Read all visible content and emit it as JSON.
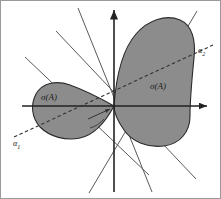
{
  "figure": {
    "name": "numerical-range-rotation-diagram",
    "background_color": "#ffffff",
    "blob_fill_color": "#8c8c8c",
    "blob_stroke_color": "#2b2b2b",
    "axis_color": "#222222",
    "ray_color": "#555555",
    "dashed_color": "#333333",
    "labels": {
      "sigma_left": "σ(A)",
      "sigma_right": "σ(A)",
      "alpha_1": "α",
      "alpha_1_sub": "1",
      "alpha_2": "α",
      "alpha_2_sub": "2"
    },
    "geometry": {
      "origin": [
        114,
        106
      ],
      "vertical_axis": [
        [
          114,
          8
        ],
        [
          114,
          192
        ]
      ],
      "horizontal_axis": [
        [
          22,
          106
        ],
        [
          209,
          106
        ]
      ],
      "dashed_axis": [
        [
          14,
          136
        ],
        [
          214,
          44
        ]
      ],
      "rays": [
        [
          [
            78,
            8
          ],
          [
            152,
            192
          ]
        ],
        [
          [
            25,
            57
          ],
          [
            148,
            174
          ]
        ],
        [
          [
            90,
            192
          ],
          [
            196,
            12
          ]
        ],
        [
          [
            196,
            178
          ],
          [
            55,
            30
          ]
        ]
      ],
      "right_blob_extent": [
        118,
        18,
        196,
        146
      ],
      "left_blob_extent": [
        33,
        82,
        114,
        139
      ]
    }
  }
}
